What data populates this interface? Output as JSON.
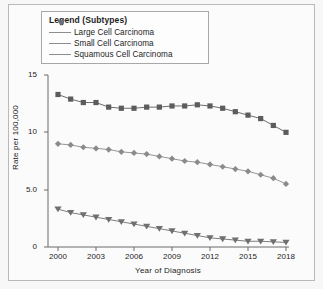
{
  "legend": {
    "title": "Legend (Subtypes)",
    "position": "top-left-inside",
    "items": [
      {
        "label": "Large Cell Carcinoma",
        "marker": "triangle-down-icon",
        "color": "#6f6f6f"
      },
      {
        "label": "Small Cell Carcinoma",
        "marker": "diamond-icon",
        "color": "#8a8a8a"
      },
      {
        "label": "Squamous Cell Carcinoma",
        "marker": "square-icon",
        "color": "#5c5c5c"
      }
    ]
  },
  "axes": {
    "ylabel": "Rate per 100,000",
    "xlabel": "Year of Diagnosis",
    "yticks": [
      "15",
      "10",
      "5.0",
      "0"
    ],
    "xticks": [
      "2000",
      "2003",
      "2006",
      "2009",
      "2012",
      "2015",
      "2018"
    ]
  },
  "chart_data": {
    "type": "line",
    "title": "",
    "xlabel": "Year of Diagnosis",
    "ylabel": "Rate per 100,000",
    "xlim": [
      2000,
      2018
    ],
    "ylim": [
      0,
      15
    ],
    "grid": false,
    "legend_position": "upper-left",
    "x": [
      2000,
      2001,
      2002,
      2003,
      2004,
      2005,
      2006,
      2007,
      2008,
      2009,
      2010,
      2011,
      2012,
      2013,
      2014,
      2015,
      2016,
      2017,
      2018
    ],
    "series": [
      {
        "name": "Squamous Cell Carcinoma",
        "marker": "square",
        "color": "#5c5c5c",
        "values": [
          13.3,
          12.9,
          12.6,
          12.6,
          12.2,
          12.1,
          12.1,
          12.2,
          12.2,
          12.3,
          12.3,
          12.4,
          12.3,
          12.1,
          11.8,
          11.5,
          11.2,
          10.6,
          10.0
        ]
      },
      {
        "name": "Small Cell Carcinoma",
        "marker": "diamond",
        "color": "#8a8a8a",
        "values": [
          9.0,
          8.9,
          8.7,
          8.6,
          8.5,
          8.3,
          8.2,
          8.1,
          7.9,
          7.7,
          7.5,
          7.4,
          7.2,
          7.0,
          6.8,
          6.6,
          6.3,
          6.0,
          5.5
        ]
      },
      {
        "name": "Large Cell Carcinoma",
        "marker": "triangle-down",
        "color": "#6f6f6f",
        "values": [
          3.3,
          3.0,
          2.8,
          2.6,
          2.4,
          2.2,
          2.0,
          1.8,
          1.6,
          1.4,
          1.2,
          1.0,
          0.8,
          0.7,
          0.6,
          0.5,
          0.5,
          0.45,
          0.4
        ]
      }
    ]
  }
}
